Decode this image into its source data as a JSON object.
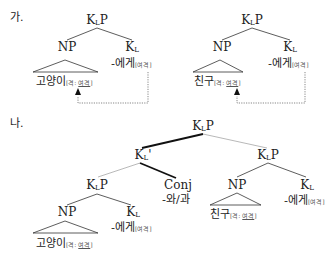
{
  "sections": {
    "ga": {
      "marker": "가."
    },
    "na": {
      "marker": "나."
    }
  },
  "labels": {
    "klp_base": "K",
    "klp_sub": "L",
    "klp_tail": "P",
    "kl_base": "K",
    "kl_sub": "L",
    "klbar_tail": "'",
    "np": "NP",
    "conj": "Conj",
    "conj_morph": "-와/과",
    "ege": "-에게",
    "ege_feat": "[여격]",
    "goyangi": "고양이",
    "chingu": "친구",
    "feat_open": "[격: ",
    "feat_val": "여격",
    "feat_close": "]"
  },
  "colors": {
    "line": "#333333",
    "thick_line": "#111111",
    "thin_line": "#777777",
    "dotted": "#555555"
  }
}
